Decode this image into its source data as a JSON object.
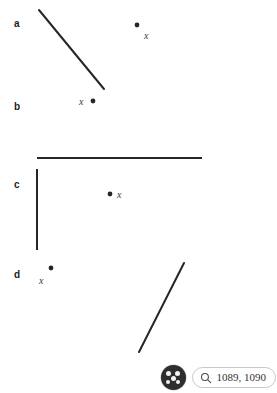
{
  "figure": {
    "background_color": "#ffffff",
    "stroke_color": "#262626",
    "label_color": "#1c1c1c",
    "point_label_color": "#3a3a3a",
    "panels": [
      {
        "id": "a",
        "label": "a",
        "label_x": 14,
        "label_y": 19,
        "point": {
          "x": 137,
          "y": 25,
          "label": "x",
          "label_x": 144,
          "label_y": 31
        },
        "lines": [
          {
            "x1": 39,
            "y1": 10,
            "x2": 104,
            "y2": 89
          }
        ]
      },
      {
        "id": "b",
        "label": "b",
        "label_x": 14,
        "label_y": 102,
        "point": {
          "x": 93,
          "y": 101,
          "label": "x",
          "label_x": 79,
          "label_y": 104
        },
        "lines": []
      },
      {
        "id": "c",
        "label": "c",
        "label_x": 14,
        "label_y": 180,
        "point": {
          "x": 110,
          "y": 194,
          "label": "x",
          "label_x": 117,
          "label_y": 197
        },
        "lines": [
          {
            "x1": 37,
            "y1": 158,
            "x2": 202,
            "y2": 158
          },
          {
            "x1": 37,
            "y1": 169,
            "x2": 37,
            "y2": 250
          }
        ]
      },
      {
        "id": "d",
        "label": "d",
        "label_x": 14,
        "label_y": 270,
        "point": {
          "x": 51,
          "y": 268,
          "label": "x",
          "label_x": 39,
          "label_y": 283
        },
        "lines": [
          {
            "x1": 139,
            "y1": 352,
            "x2": 184,
            "y2": 263
          }
        ]
      }
    ]
  },
  "overlay": {
    "badge_icon": "cursor-cluster-icon",
    "badge_color": "#2e2e2e",
    "search_icon": "search-icon",
    "coordinates": "1089, 1090"
  }
}
